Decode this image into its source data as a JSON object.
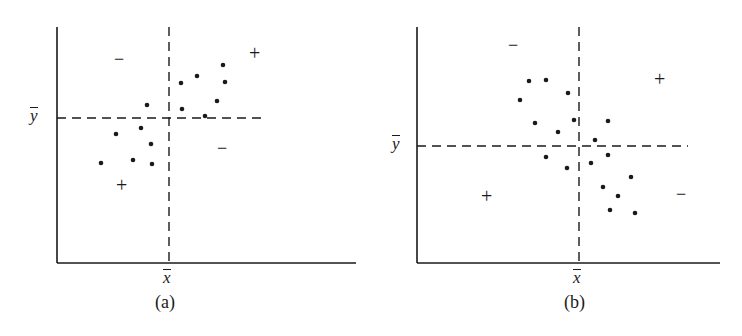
{
  "figure": {
    "panels": [
      {
        "id": "a",
        "caption": "(a)",
        "x_label": "x",
        "y_label": "y",
        "quadrant_signs": {
          "upper_left": "−",
          "upper_right": "+",
          "lower_left": "+",
          "lower_right": "−"
        },
        "relationship": "positive"
      },
      {
        "id": "b",
        "caption": "(b)",
        "x_label": "x",
        "y_label": "y",
        "quadrant_signs": {
          "upper_left": "−",
          "upper_right": "+",
          "lower_left": "+",
          "lower_right": "−"
        },
        "relationship": "negative"
      }
    ]
  },
  "chart_data": [
    {
      "type": "scatter",
      "title": "(a)",
      "xlabel": "x̄",
      "ylabel": "ȳ",
      "grid": false,
      "reference_lines": {
        "x_mean": 0,
        "y_mean": 0,
        "style": "dashed"
      },
      "quadrant_signs": {
        "upper_left": "−",
        "upper_right": "+",
        "lower_left": "+",
        "lower_right": "−"
      },
      "points_px": [
        [
          101,
          163
        ],
        [
          116,
          134
        ],
        [
          133,
          160
        ],
        [
          141,
          128
        ],
        [
          147,
          105
        ],
        [
          151,
          144
        ],
        [
          152,
          164
        ],
        [
          181,
          83
        ],
        [
          182,
          109
        ],
        [
          197,
          76
        ],
        [
          205,
          116
        ],
        [
          217,
          101
        ],
        [
          223,
          65
        ],
        [
          225,
          82
        ]
      ]
    },
    {
      "type": "scatter",
      "title": "(b)",
      "xlabel": "x̄",
      "ylabel": "ȳ",
      "grid": false,
      "reference_lines": {
        "x_mean": 0,
        "y_mean": 0,
        "style": "dashed"
      },
      "quadrant_signs": {
        "upper_left": "−",
        "upper_right": "+",
        "lower_left": "+",
        "lower_right": "−"
      },
      "points_px": [
        [
          520,
          100
        ],
        [
          529,
          81
        ],
        [
          546,
          80
        ],
        [
          535,
          123
        ],
        [
          558,
          132
        ],
        [
          568,
          93
        ],
        [
          574,
          120
        ],
        [
          546,
          157
        ],
        [
          567,
          168
        ],
        [
          595,
          140
        ],
        [
          591,
          163
        ],
        [
          608,
          121
        ],
        [
          608,
          155
        ],
        [
          603,
          187
        ],
        [
          618,
          196
        ],
        [
          610,
          210
        ],
        [
          631,
          177
        ],
        [
          635,
          213
        ]
      ]
    }
  ]
}
